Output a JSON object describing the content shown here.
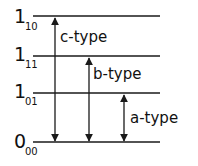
{
  "diagram": {
    "type": "energy-level-diagram",
    "levels": [
      {
        "main": "1",
        "sub": "10",
        "y": 16
      },
      {
        "main": "1",
        "sub": "11",
        "y": 56
      },
      {
        "main": "1",
        "sub": "01",
        "y": 93
      },
      {
        "main": "0",
        "sub": "00",
        "y": 142
      }
    ],
    "transitions": [
      {
        "label": "c-type",
        "x": 55,
        "from_level": "0_00",
        "to_level": "1_10"
      },
      {
        "label": "b-type",
        "x": 89,
        "from_level": "0_00",
        "to_level": "1_11"
      },
      {
        "label": "a-type",
        "x": 124,
        "from_level": "0_00",
        "to_level": "1_01"
      }
    ],
    "line_color": "#1a1a1a"
  }
}
